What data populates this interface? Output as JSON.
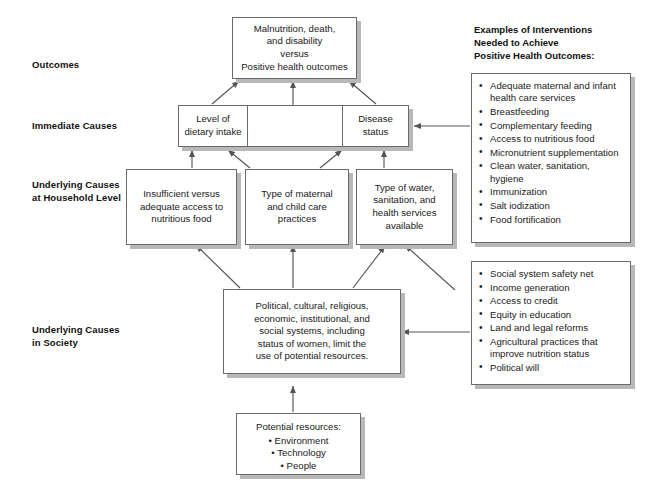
{
  "diagram": {
    "row_labels": [
      {
        "id": "outcomes",
        "text": "Outcomes"
      },
      {
        "id": "immediate-causes",
        "text": "Immediate Causes"
      },
      {
        "id": "underlying-causes-household",
        "line1": "Underlying Causes",
        "line2": "at Household Level"
      },
      {
        "id": "underlying-causes-society",
        "line1": "Underlying Causes",
        "line2": "in Society"
      }
    ],
    "boxes": {
      "outcome": {
        "line1": "Malnutrition, death,",
        "line2": "and disability",
        "line3": "versus",
        "line4": "Positive health outcomes"
      },
      "dietary_intake": {
        "line1": "Level of",
        "line2": "dietary intake"
      },
      "disease_status": {
        "line1": "Disease status"
      },
      "food_access": {
        "line1": "Insufficient versus",
        "line2": "adequate access to",
        "line3": "nutritious food"
      },
      "care_practices": {
        "line1": "Type of maternal",
        "line2": "and child care",
        "line3": "practices"
      },
      "water_health_services": {
        "line1": "Type of water,",
        "line2": "sanitation, and",
        "line3": "health services",
        "line4": "available"
      },
      "societal_systems": {
        "line1": "Political, cultural, religious,",
        "line2": "economic, institutional, and",
        "line3": "social systems, including",
        "line4": "status of women, limit the",
        "line5": "use of potential resources."
      },
      "potential_resources": {
        "title": "Potential resources:",
        "items": [
          "Environment",
          "Technology",
          "People"
        ]
      }
    },
    "panels": {
      "interventions": {
        "title_line1": "Examples of Interventions",
        "title_line2": "Needed to Achieve",
        "title_line3": "Positive Health Outcomes:",
        "items": [
          "Adequate maternal and infant health care services",
          "Breastfeeding",
          "Complementary feeding",
          "Access to nutritious food",
          "Micronutrient supplementation",
          "Clean water, sanitation, hygiene",
          "Immunization",
          "Salt iodization",
          "Food fortification"
        ]
      },
      "society_interventions": {
        "items": [
          "Social system safety net",
          "Income generation",
          "Access to credit",
          "Equity in education",
          "Land and legal reforms",
          "Agricultural practices that improve nutrition status",
          "Political will"
        ]
      }
    },
    "colors": {
      "border": "#6a6a6a",
      "shadow": "#b8b8b8",
      "arrow": "#555555",
      "text": "#1a1a1a",
      "background": "#ffffff"
    }
  }
}
